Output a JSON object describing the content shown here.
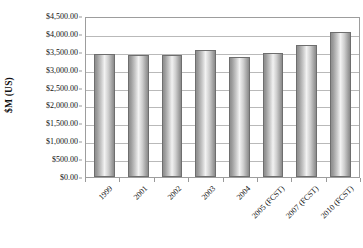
{
  "chart_data": {
    "type": "bar",
    "title": "",
    "xlabel": "",
    "ylabel": "$M (US)",
    "categories": [
      "1999",
      "2001",
      "2002",
      "2003",
      "2004",
      "2005 (FCST)",
      "2007 (FCST)",
      "2010 (FCST)"
    ],
    "values": [
      3450,
      3400,
      3400,
      3550,
      3350,
      3480,
      3700,
      4050
    ],
    "ylim": [
      0,
      4500
    ],
    "ytick_step": 500,
    "ytick_labels": [
      "$4,500.00",
      "$4,000.00",
      "$3,500.00",
      "$3,000.00",
      "$2,500.00",
      "$2,000.00",
      "$1,500.00",
      "$1,000.00",
      "$500.00",
      "$0.00"
    ],
    "ytick_values": [
      4500,
      4000,
      3500,
      3000,
      2500,
      2000,
      1500,
      1000,
      500,
      0
    ],
    "grid": true,
    "legend": false,
    "legend_position": "none",
    "series": [
      {
        "name": "",
        "values": [
          3450,
          3400,
          3400,
          3550,
          3350,
          3480,
          3700,
          4050
        ]
      }
    ],
    "colors": {
      "bar_edge": "#6e6e6e",
      "bar_fill_dark": "#8e8e8e",
      "bar_fill_light": "#f2f2f2",
      "gridline": "#b9b9b9",
      "axis_border": "#9d9d9d",
      "text": "#111111",
      "background": "#ffffff"
    }
  }
}
